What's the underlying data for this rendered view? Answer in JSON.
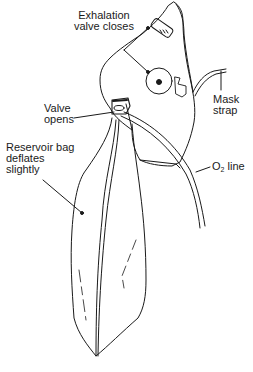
{
  "diagram": {
    "type": "illustration",
    "labels": {
      "exhalation_valve": {
        "line1": "Exhalation",
        "line2": "valve closes"
      },
      "mask_strap": {
        "line1": "Mask",
        "line2": "strap"
      },
      "valve_opens": {
        "line1": "Valve",
        "line2": "opens"
      },
      "reservoir_bag": {
        "line1": "Reservoir bag",
        "line2": "deflates",
        "line3": "slightly"
      },
      "o2_line": {
        "prefix": "O",
        "subscript": "2",
        "suffix": " line"
      }
    },
    "colors": {
      "stroke": "#1a1a1a",
      "background": "#ffffff"
    }
  }
}
